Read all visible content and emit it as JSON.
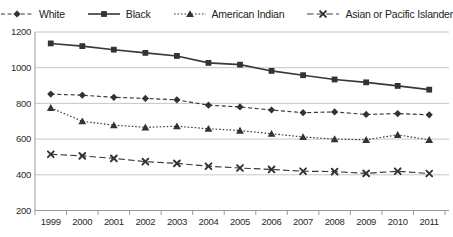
{
  "chart_data": {
    "type": "line",
    "title": "",
    "xlabel": "",
    "ylabel": "",
    "categories": [
      "1999",
      "2000",
      "2001",
      "2002",
      "2003",
      "2004",
      "2005",
      "2006",
      "2007",
      "2008",
      "2009",
      "2010",
      "2011"
    ],
    "ylim": [
      200,
      1200
    ],
    "yticks": [
      200,
      400,
      600,
      800,
      1000,
      1200
    ],
    "grid": "horizontal",
    "legend_position": "top",
    "series": [
      {
        "name": "White",
        "marker": "diamond",
        "line": "dashed",
        "values": [
          852,
          846,
          834,
          828,
          820,
          790,
          780,
          763,
          748,
          752,
          738,
          743,
          736
        ]
      },
      {
        "name": "Black",
        "marker": "square",
        "line": "solid",
        "values": [
          1136,
          1121,
          1101,
          1083,
          1066,
          1027,
          1017,
          982,
          958,
          934,
          918,
          898,
          877
        ]
      },
      {
        "name": "American Indian",
        "marker": "triangle",
        "line": "dotted",
        "values": [
          775,
          700,
          678,
          666,
          672,
          658,
          648,
          630,
          612,
          600,
          596,
          624,
          596
        ]
      },
      {
        "name": "Asian or Pacific Islander",
        "marker": "x",
        "line": "dashdot",
        "values": [
          515,
          506,
          492,
          474,
          464,
          448,
          438,
          430,
          420,
          418,
          408,
          420,
          407
        ]
      }
    ],
    "colors": {
      "series": "#383838",
      "marker_fill": "#333333",
      "gridline": "#c6c6c6",
      "axis_line": "#9a9a9a",
      "tick_text": "#2b2b2b"
    }
  }
}
